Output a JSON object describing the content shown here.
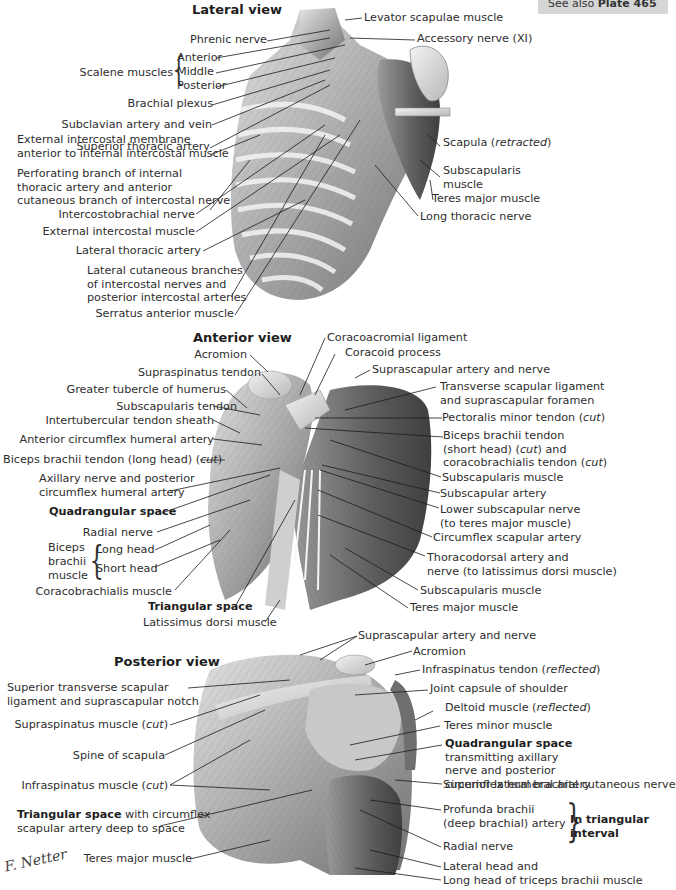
{
  "plate_reference": {
    "prefix": "See also",
    "plate": "Plate 465"
  },
  "lateral_view": {
    "title": "Lateral view",
    "labels": {
      "levator_scapulae": "Levator scapulae muscle",
      "accessory_nerve": "Accessory nerve (XI)",
      "phrenic_nerve": "Phrenic nerve",
      "scalene_group": "Scalene muscles",
      "scalene_anterior": "Anterior",
      "scalene_middle": "Middle",
      "scalene_posterior": "Posterior",
      "brachial_plexus": "Brachial plexus",
      "subclavian": "Subclavian artery and vein",
      "superior_thoracic": "Superior thoracic artery",
      "ext_intercostal_membrane_1": "External intercostal membrane",
      "ext_intercostal_membrane_2": "anterior to internal intercostal muscle",
      "perforating_1": "Perforating branch of internal",
      "perforating_2": "thoracic artery and anterior",
      "perforating_3": "cutaneous branch of intercostal nerve",
      "intercostobrachial": "Intercostobrachial nerve",
      "external_intercostal": "External intercostal muscle",
      "lateral_thoracic": "Lateral thoracic artery",
      "lateral_cutaneous_1": "Lateral cutaneous branches",
      "lateral_cutaneous_2": "of intercostal nerves and",
      "lateral_cutaneous_3": "posterior intercostal arteries",
      "serratus_anterior": "Serratus anterior muscle",
      "scapula": "Scapula",
      "scapula_note": "retracted",
      "subscapularis_1": "Subscapularis",
      "subscapularis_2": "muscle",
      "teres_major": "Teres major muscle",
      "long_thoracic": "Long thoracic nerve"
    }
  },
  "anterior_view": {
    "title": "Anterior view",
    "labels": {
      "coracoacromial": "Coracoacromial ligament",
      "coracoid": "Coracoid process",
      "acromion": "Acromion",
      "supraspinatus_tendon": "Supraspinatus tendon",
      "suprascapular": "Suprascapular artery and nerve",
      "greater_tubercle": "Greater tubercle of humerus",
      "transverse_lig_1": "Transverse scapular ligament",
      "transverse_lig_2": "and suprascapular foramen",
      "subscapularis_tendon": "Subscapularis tendon",
      "pectoralis_minor": "Pectoralis minor tendon",
      "cut": "cut",
      "intertubercular": "Intertubercular tendon sheath",
      "biceps_short_1": "Biceps brachii tendon",
      "biceps_short_2a": "(short head) (",
      "biceps_short_2b": ") and",
      "biceps_short_3": "coracobrachialis tendon",
      "ant_circumflex": "Anterior circumflex humeral artery",
      "biceps_long": "Biceps brachii tendon (long head)",
      "subscapularis_muscle": "Subscapularis muscle",
      "axillary_1": "Axillary nerve and posterior",
      "axillary_2": "circumflex humeral artery",
      "subscapular_artery": "Subscapular artery",
      "quadrangular": "Quadrangular space",
      "lower_subscapular_1": "Lower subscapular nerve",
      "lower_subscapular_2": "(to teres major muscle)",
      "radial_nerve": "Radial nerve",
      "circumflex_scapular": "Circumflex scapular artery",
      "biceps_group_1": "Biceps",
      "biceps_group_2": "brachii",
      "biceps_group_3": "muscle",
      "long_head": "Long head",
      "short_head": "Short head",
      "thoracodorsal_1": "Thoracodorsal artery and",
      "thoracodorsal_2": "nerve (to latissimus dorsi muscle)",
      "subscapularis_muscle_2": "Subscapularis muscle",
      "coracobrachialis": "Coracobrachialis muscle",
      "triangular": "Triangular space",
      "teres_major": "Teres major muscle",
      "latissimus": "Latissimus dorsi muscle"
    }
  },
  "posterior_view": {
    "title": "Posterior view",
    "labels": {
      "suprascapular": "Suprascapular artery and nerve",
      "acromion": "Acromion",
      "infraspinatus_tendon": "Infraspinatus tendon",
      "reflected": "reflected",
      "sup_transverse_1": "Superior transverse scapular",
      "sup_transverse_2": "ligament and suprascapular notch",
      "joint_capsule": "Joint capsule of shoulder",
      "deltoid": "Deltoid muscle",
      "supraspinatus": "Supraspinatus muscle",
      "cut": "cut",
      "teres_minor": "Teres minor muscle",
      "quadrangular_title": "Quadrangular space",
      "quadrangular_1": "transmitting axillary",
      "quadrangular_2": "nerve and posterior",
      "quadrangular_3": "circumflex humeral artery",
      "spine": "Spine of scapula",
      "infraspinatus": "Infraspinatus muscle",
      "sup_lat_cutaneous": "Superior lateral brachial cutaneous nerve",
      "triangular_title": "Triangular space",
      "triangular_1": "with circumflex",
      "triangular_2": "scapular artery deep to space",
      "profunda_1": "Profunda brachii",
      "profunda_2": "(deep brachial) artery",
      "triangular_interval_1": "In triangular",
      "triangular_interval_2": "interval",
      "radial_nerve": "Radial nerve",
      "teres_major": "Teres major muscle",
      "lateral_head": "Lateral head and",
      "long_head": "Long head of triceps brachii muscle"
    }
  },
  "signature": "F. Netter"
}
